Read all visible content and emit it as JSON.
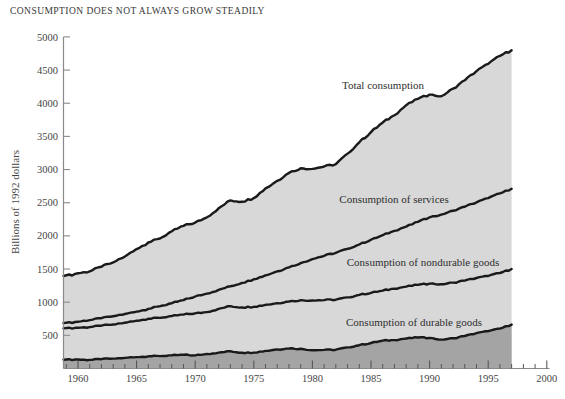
{
  "title": "CONSUMPTION DOES NOT ALWAYS GROW STEADILY",
  "chart_data": {
    "type": "area",
    "title": "CONSUMPTION DOES NOT ALWAYS GROW STEADILY",
    "xlabel": "",
    "ylabel": "Billions of 1992 dollars",
    "xlim": [
      1958.7,
      2000
    ],
    "ylim": [
      0,
      5000
    ],
    "grid": false,
    "legend_position": "inline-annotations",
    "x_ticks": [
      1960,
      1965,
      1970,
      1975,
      1980,
      1985,
      1990,
      1995,
      2000
    ],
    "x_minor_tick_range": [
      1959,
      1999
    ],
    "y_ticks": [
      500,
      1000,
      1500,
      2000,
      2500,
      3000,
      3500,
      4000,
      4500,
      5000
    ],
    "years": [
      1959,
      1960,
      1961,
      1962,
      1963,
      1964,
      1965,
      1966,
      1967,
      1968,
      1969,
      1970,
      1971,
      1972,
      1973,
      1974,
      1975,
      1976,
      1977,
      1978,
      1979,
      1980,
      1981,
      1982,
      1983,
      1984,
      1985,
      1986,
      1987,
      1988,
      1989,
      1990,
      1991,
      1992,
      1993,
      1994,
      1995,
      1996,
      1997
    ],
    "series": [
      {
        "name": "Total consumption",
        "fill": "light",
        "values": [
          1395,
          1435,
          1465,
          1535,
          1600,
          1690,
          1800,
          1900,
          1960,
          2070,
          2150,
          2200,
          2280,
          2415,
          2535,
          2515,
          2570,
          2715,
          2830,
          2950,
          3020,
          3010,
          3046,
          3080,
          3240,
          3410,
          3565,
          3710,
          3820,
          3970,
          4065,
          4130,
          4105,
          4220,
          4345,
          4485,
          4595,
          4715,
          4800
        ]
      },
      {
        "name": "Consumption of services",
        "fill": "none",
        "values": [
          685,
          705,
          730,
          758,
          788,
          822,
          858,
          898,
          940,
          985,
          1032,
          1085,
          1130,
          1185,
          1240,
          1290,
          1345,
          1405,
          1465,
          1525,
          1590,
          1650,
          1700,
          1745,
          1805,
          1870,
          1940,
          2010,
          2075,
          2140,
          2210,
          2280,
          2320,
          2380,
          2440,
          2505,
          2570,
          2640,
          2710
        ]
      },
      {
        "name": "Consumption of nondurable goods",
        "fill": "none",
        "values": [
          605,
          615,
          625,
          645,
          663,
          690,
          720,
          750,
          763,
          792,
          812,
          832,
          850,
          900,
          940,
          920,
          930,
          960,
          985,
          1010,
          1030,
          1025,
          1032,
          1038,
          1072,
          1110,
          1140,
          1175,
          1205,
          1235,
          1260,
          1280,
          1270,
          1295,
          1325,
          1365,
          1395,
          1440,
          1500
        ]
      },
      {
        "name": "Consumption of durable goods",
        "fill": "dark",
        "values": [
          132,
          135,
          130,
          140,
          150,
          160,
          172,
          184,
          187,
          200,
          206,
          198,
          218,
          240,
          260,
          237,
          240,
          266,
          288,
          302,
          298,
          276,
          280,
          283,
          318,
          352,
          384,
          420,
          428,
          453,
          468,
          460,
          436,
          455,
          490,
          532,
          562,
          602,
          662
        ]
      }
    ],
    "colors": {
      "area_light": "#d8d8d8",
      "area_dark": "#a4a4a4",
      "line": "#1a1a1a",
      "axis": "#8a8a8a",
      "tick": "#565656",
      "text": "#454545"
    }
  }
}
